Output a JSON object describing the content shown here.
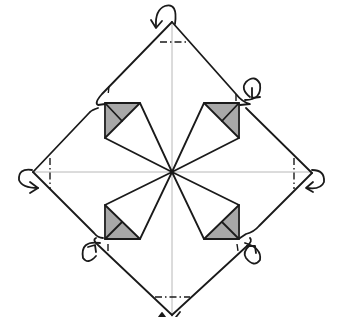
{
  "diagram": {
    "title": "",
    "type": "origami-crease-pattern",
    "caption": "Origami step: diamond with four kite flaps; mountain-fold the four corners behind",
    "colors": {
      "line": "#1a1a1a",
      "crease": "#b8b8b8",
      "shade": "#a8a8a8",
      "background": "#ffffff"
    },
    "center": [
      172,
      172
    ],
    "outline": {
      "top": [
        172,
        22
      ],
      "right": [
        312,
        173
      ],
      "bottom": [
        172,
        315
      ],
      "left": [
        33,
        172
      ]
    },
    "kites": [
      {
        "id": "upper-left",
        "tip": [
          172,
          172
        ],
        "corner": [
          105,
          103
        ],
        "side_a": [
          140,
          103
        ],
        "side_b": [
          105,
          138
        ]
      },
      {
        "id": "upper-right",
        "tip": [
          172,
          172
        ],
        "corner": [
          239,
          103
        ],
        "side_a": [
          204,
          103
        ],
        "side_b": [
          239,
          138
        ]
      },
      {
        "id": "lower-left",
        "tip": [
          172,
          172
        ],
        "corner": [
          105,
          239
        ],
        "side_a": [
          140,
          239
        ],
        "side_b": [
          105,
          205
        ]
      },
      {
        "id": "lower-right",
        "tip": [
          172,
          172
        ],
        "corner": [
          239,
          239
        ],
        "side_a": [
          204,
          239
        ],
        "side_b": [
          239,
          205
        ]
      }
    ],
    "fold_marks": [
      {
        "id": "top-mountain-fold",
        "type": "mountain"
      },
      {
        "id": "left-mountain-fold",
        "type": "mountain"
      },
      {
        "id": "right-mountain-fold",
        "type": "mountain"
      },
      {
        "id": "bottom-mountain-fold",
        "type": "mountain"
      }
    ],
    "arrows": [
      {
        "id": "top-fold-behind-arrow",
        "position": "top"
      },
      {
        "id": "upper-right-fold-behind-arrow",
        "position": "upper-right"
      },
      {
        "id": "left-fold-behind-arrow",
        "position": "left"
      },
      {
        "id": "right-fold-behind-arrow",
        "position": "right"
      },
      {
        "id": "lower-left-fold-behind-arrow",
        "position": "lower-left"
      },
      {
        "id": "lower-right-fold-behind-arrow",
        "position": "lower-right"
      }
    ]
  }
}
